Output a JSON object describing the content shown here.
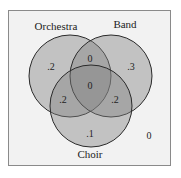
{
  "diagram": {
    "type": "venn3",
    "sets": [
      {
        "name": "Orchestra",
        "cx": 70,
        "cy": 76,
        "r": 41
      },
      {
        "name": "Band",
        "cx": 111,
        "cy": 76,
        "r": 41
      },
      {
        "name": "Choir",
        "cx": 91,
        "cy": 106,
        "r": 41
      }
    ],
    "labels": {
      "orchestra": "Orchestra",
      "band": "Band",
      "choir": "Choir"
    },
    "regions": {
      "orchestra_only": ".2",
      "band_only": ".3",
      "choir_only": ".1",
      "orchestra_band_only": "0",
      "orchestra_choir_only": ".2",
      "band_choir_only": ".2",
      "all_three": "0",
      "outside": "0"
    },
    "colors": {
      "circle_fill": "#808080",
      "circle_stroke": "#2a2a2a",
      "frame_bg": "#f2f2f2",
      "frame_border": "#8a8a8a",
      "text": "#222222"
    }
  }
}
